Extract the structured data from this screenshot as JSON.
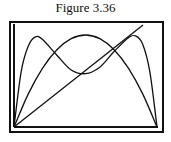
{
  "figure": {
    "title": "Figure 3.36"
  },
  "chart_data": {
    "type": "line",
    "title": "Figure 3.36",
    "xlabel": "",
    "ylabel": "",
    "grid": false,
    "legend": "none",
    "xlim": [
      0,
      1
    ],
    "ylim": [
      0,
      1
    ],
    "series": [
      {
        "name": "line",
        "x": [
          0,
          1.1
        ],
        "y": [
          0,
          1.1
        ]
      },
      {
        "name": "dome",
        "x": [
          0,
          0.1,
          0.2,
          0.3,
          0.4,
          0.5,
          0.6,
          0.7,
          0.8,
          0.9,
          1.0
        ],
        "y": [
          0,
          0.36,
          0.64,
          0.84,
          0.96,
          1.0,
          0.96,
          0.84,
          0.64,
          0.36,
          0
        ]
      },
      {
        "name": "double-hump",
        "x": [
          0,
          0.05,
          0.1,
          0.15,
          0.2,
          0.3,
          0.4,
          0.5,
          0.6,
          0.7,
          0.8,
          0.85,
          0.9,
          0.95,
          1.0
        ],
        "y": [
          0,
          0.6,
          0.88,
          0.98,
          0.95,
          0.78,
          0.62,
          0.58,
          0.65,
          0.82,
          0.97,
          0.99,
          0.9,
          0.6,
          0
        ]
      }
    ]
  }
}
